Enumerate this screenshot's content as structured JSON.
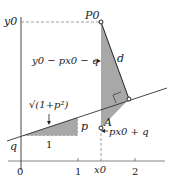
{
  "diagram": {
    "type": "geometry-distance-point-to-line",
    "axes": {
      "y_label": "y0",
      "x_ticks": [
        "0",
        "1",
        "x0",
        "2"
      ]
    },
    "labels": {
      "point_p0": "P0",
      "point_a": "A",
      "intercept": "q",
      "slope_run": "1",
      "slope_rise": "p",
      "hypotenuse": "√(1+p²)",
      "vertical_diff": "y0 − px0 − q",
      "distance": "d",
      "line_value": "px0 + q"
    },
    "colors": {
      "shade": "#a6a6a6",
      "line": "#333333",
      "dash": "#777777"
    }
  }
}
